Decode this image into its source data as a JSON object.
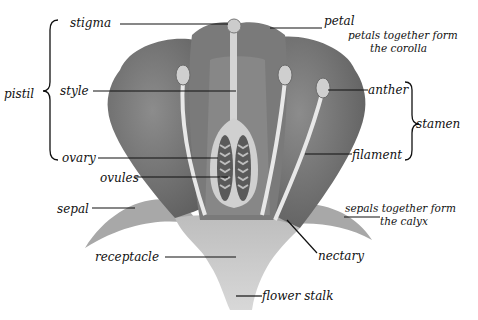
{
  "diagram": {
    "colors": {
      "background": "#ffffff",
      "petal_dark": "#6a6a6a",
      "petal_mid": "#8a8a8a",
      "receptacle": "#c9c9c9",
      "filament": "#e6e6e6",
      "ink": "#111111"
    },
    "labels": {
      "stigma": "stigma",
      "style": "style",
      "pistil": "pistil",
      "ovary": "ovary",
      "ovules": "ovules",
      "sepal": "sepal",
      "receptacle": "receptacle",
      "petal": "petal",
      "corolla_line1": "petals together form",
      "corolla_line2": "the corolla",
      "anther": "anther",
      "stamen": "stamen",
      "filament": "filament",
      "calyx_line1": "sepals together form",
      "calyx_line2": "the calyx",
      "nectary": "nectary",
      "flower_stalk": "flower stalk"
    }
  }
}
